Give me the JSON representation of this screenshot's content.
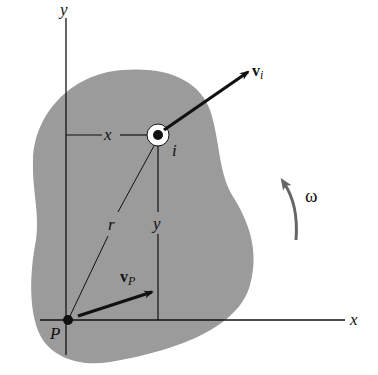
{
  "diagram": {
    "type": "rigid-body-kinematics",
    "colors": {
      "body_fill": "#9b9b9b",
      "line": "#111111",
      "omega_arrow": "#666666",
      "background": "#ffffff"
    },
    "axes": {
      "x_label": "x",
      "y_label": "y"
    },
    "points": {
      "P_label": "P",
      "i_label": "i"
    },
    "dimensions": {
      "horizontal_label": "x",
      "vertical_label": "y",
      "radius_label": "r"
    },
    "vectors": {
      "vi_main": "v",
      "vi_sub": "i",
      "vp_main": "v",
      "vp_sub": "P"
    },
    "rotation": {
      "label": "ω"
    }
  }
}
